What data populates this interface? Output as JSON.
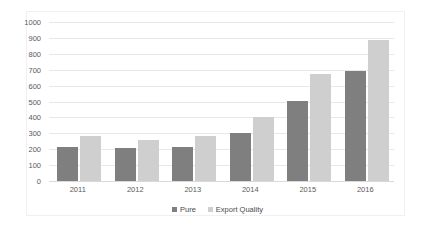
{
  "chart_data": {
    "type": "bar",
    "title": "",
    "subtitle": "",
    "xlabel": "",
    "ylabel": "",
    "categories": [
      "2011",
      "2012",
      "2013",
      "2014",
      "2015",
      "2016"
    ],
    "series": [
      {
        "name": "Pure",
        "color": "#7f7f7f",
        "values": [
          215,
          205,
          215,
          305,
          505,
          695
        ]
      },
      {
        "name": "Export Quality",
        "color": "#cfcfcf",
        "values": [
          285,
          255,
          285,
          400,
          675,
          885
        ]
      }
    ],
    "ylim": [
      0,
      1000
    ],
    "ytick_step": 100,
    "yticks": [
      "1000",
      "900",
      "800",
      "700",
      "600",
      "500",
      "400",
      "300",
      "200",
      "100",
      "0"
    ],
    "grid": true,
    "legend_position": "bottom"
  },
  "colors": {
    "series_pure": "#7f7f7f",
    "series_export": "#cfcfcf",
    "gridline": "#e8e8e8",
    "axis_text": "#5a5a5a",
    "background": "#ffffff",
    "frame": "#f0f0f0"
  }
}
